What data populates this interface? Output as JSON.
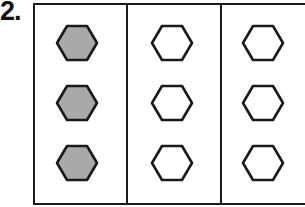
{
  "problem": {
    "number": "2."
  },
  "colors": {
    "shaded": "#a9a9a9",
    "outline": "#1a1a1a",
    "empty": "#ffffff"
  },
  "groups": [
    {
      "label": "group-1",
      "hexagons": [
        {
          "shaded": true
        },
        {
          "shaded": true
        },
        {
          "shaded": true
        }
      ]
    },
    {
      "label": "group-2",
      "hexagons": [
        {
          "shaded": false
        },
        {
          "shaded": false
        },
        {
          "shaded": false
        }
      ]
    },
    {
      "label": "group-3",
      "hexagons": [
        {
          "shaded": false
        },
        {
          "shaded": false
        },
        {
          "shaded": false
        }
      ]
    }
  ]
}
